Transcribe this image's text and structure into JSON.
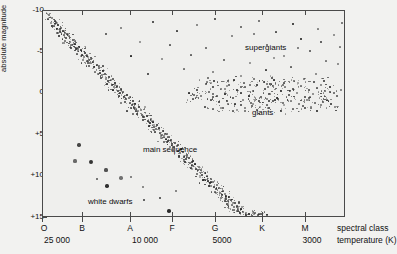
{
  "figure": {
    "kind": "hertzsprung-russell-diagram",
    "background_color": "#f2f2f0",
    "plot_background_color": "#efefed",
    "frame_color": "#4a4a4a",
    "point_color": "#2a2a2a"
  },
  "axes": {
    "y_axis_title": "absolute magnitude",
    "y_tick_labels": [
      "-10",
      "-5",
      "0",
      "+5",
      "+10",
      "+15"
    ],
    "x_class_label": "spectral class",
    "x_temperature_label": "temperature (K)",
    "x_class_ticks": [
      "O",
      "B",
      "A",
      "F",
      "G",
      "K",
      "M"
    ],
    "x_temperature_ticks": [
      "25 000",
      "10 000",
      "5000",
      "3000"
    ]
  },
  "region_labels": [
    {
      "text": "supergiants",
      "x": 245,
      "y": 44
    },
    {
      "text": "giants",
      "x": 252,
      "y": 109
    },
    {
      "text": "main sequence",
      "x": 143,
      "y": 146
    },
    {
      "text": "white dwarfs",
      "x": 88,
      "y": 198
    }
  ],
  "chart_data": {
    "type": "scatter",
    "xlabel": "spectral class / temperature (K)",
    "ylabel": "absolute magnitude",
    "xlim_classes": [
      "O",
      "B",
      "A",
      "F",
      "G",
      "K",
      "M"
    ],
    "ylim": [
      -10,
      15
    ],
    "y_inverted": true,
    "grid": false,
    "legend": "none",
    "x_tick_positions_px": [
      42,
      82,
      130,
      172,
      215,
      262,
      305
    ],
    "y_tick_positions_px": [
      10,
      51,
      92,
      134,
      175,
      217
    ],
    "x_temperature_tick_positions_px": [
      42,
      130,
      215,
      305
    ],
    "annotations": [
      "supergiants",
      "giants",
      "main sequence",
      "white dwarfs"
    ],
    "series": [
      {
        "name": "main sequence",
        "note": "dense diagonal band from upper-left (hot, luminous) to lower-right (cool, faint)",
        "points": [
          [
            45,
            12
          ],
          [
            48,
            14
          ],
          [
            47,
            18
          ],
          [
            51,
            17
          ],
          [
            50,
            22
          ],
          [
            54,
            20
          ],
          [
            53,
            25
          ],
          [
            57,
            24
          ],
          [
            56,
            28
          ],
          [
            60,
            27
          ],
          [
            59,
            31
          ],
          [
            62,
            30
          ],
          [
            58,
            35
          ],
          [
            63,
            34
          ],
          [
            66,
            33
          ],
          [
            65,
            37
          ],
          [
            68,
            36
          ],
          [
            64,
            40
          ],
          [
            69,
            41
          ],
          [
            72,
            39
          ],
          [
            71,
            44
          ],
          [
            74,
            43
          ],
          [
            70,
            47
          ],
          [
            75,
            48
          ],
          [
            78,
            46
          ],
          [
            77,
            50
          ],
          [
            80,
            49
          ],
          [
            76,
            53
          ],
          [
            81,
            54
          ],
          [
            84,
            52
          ],
          [
            83,
            56
          ],
          [
            86,
            55
          ],
          [
            82,
            59
          ],
          [
            87,
            60
          ],
          [
            90,
            58
          ],
          [
            89,
            62
          ],
          [
            92,
            61
          ],
          [
            88,
            65
          ],
          [
            93,
            66
          ],
          [
            96,
            64
          ],
          [
            95,
            68
          ],
          [
            98,
            67
          ],
          [
            94,
            71
          ],
          [
            99,
            72
          ],
          [
            102,
            70
          ],
          [
            101,
            74
          ],
          [
            104,
            73
          ],
          [
            100,
            77
          ],
          [
            105,
            78
          ],
          [
            108,
            76
          ],
          [
            107,
            80
          ],
          [
            110,
            79
          ],
          [
            106,
            83
          ],
          [
            111,
            84
          ],
          [
            114,
            82
          ],
          [
            113,
            86
          ],
          [
            116,
            85
          ],
          [
            112,
            89
          ],
          [
            117,
            90
          ],
          [
            120,
            88
          ],
          [
            119,
            92
          ],
          [
            122,
            91
          ],
          [
            118,
            95
          ],
          [
            123,
            96
          ],
          [
            126,
            94
          ],
          [
            125,
            98
          ],
          [
            128,
            97
          ],
          [
            124,
            101
          ],
          [
            129,
            102
          ],
          [
            132,
            100
          ],
          [
            131,
            104
          ],
          [
            134,
            103
          ],
          [
            130,
            107
          ],
          [
            135,
            108
          ],
          [
            138,
            106
          ],
          [
            137,
            110
          ],
          [
            140,
            109
          ],
          [
            136,
            113
          ],
          [
            141,
            114
          ],
          [
            144,
            112
          ],
          [
            143,
            116
          ],
          [
            146,
            115
          ],
          [
            142,
            119
          ],
          [
            147,
            120
          ],
          [
            150,
            118
          ],
          [
            149,
            122
          ],
          [
            152,
            121
          ],
          [
            148,
            125
          ],
          [
            153,
            126
          ],
          [
            156,
            124
          ],
          [
            155,
            128
          ],
          [
            158,
            127
          ],
          [
            154,
            131
          ],
          [
            159,
            132
          ],
          [
            162,
            130
          ],
          [
            161,
            134
          ],
          [
            164,
            133
          ],
          [
            160,
            137
          ],
          [
            165,
            138
          ],
          [
            168,
            136
          ],
          [
            167,
            140
          ],
          [
            170,
            139
          ],
          [
            166,
            143
          ],
          [
            171,
            144
          ],
          [
            174,
            142
          ],
          [
            173,
            146
          ],
          [
            176,
            145
          ],
          [
            172,
            149
          ],
          [
            177,
            150
          ],
          [
            180,
            148
          ],
          [
            179,
            152
          ],
          [
            182,
            151
          ],
          [
            178,
            155
          ],
          [
            183,
            156
          ],
          [
            186,
            154
          ],
          [
            185,
            158
          ],
          [
            188,
            157
          ],
          [
            184,
            161
          ],
          [
            189,
            162
          ],
          [
            192,
            160
          ],
          [
            191,
            164
          ],
          [
            194,
            163
          ],
          [
            190,
            167
          ],
          [
            195,
            168
          ],
          [
            198,
            166
          ],
          [
            197,
            170
          ],
          [
            200,
            169
          ],
          [
            196,
            173
          ],
          [
            201,
            174
          ],
          [
            204,
            172
          ],
          [
            203,
            176
          ],
          [
            206,
            175
          ],
          [
            202,
            179
          ],
          [
            207,
            180
          ],
          [
            210,
            178
          ],
          [
            209,
            182
          ],
          [
            212,
            181
          ],
          [
            208,
            185
          ],
          [
            213,
            186
          ],
          [
            216,
            184
          ],
          [
            215,
            188
          ],
          [
            218,
            187
          ],
          [
            214,
            191
          ],
          [
            219,
            192
          ],
          [
            222,
            190
          ],
          [
            221,
            194
          ],
          [
            224,
            193
          ],
          [
            220,
            197
          ],
          [
            225,
            198
          ],
          [
            228,
            196
          ],
          [
            227,
            200
          ],
          [
            230,
            199
          ],
          [
            226,
            203
          ],
          [
            231,
            204
          ],
          [
            234,
            202
          ],
          [
            233,
            206
          ],
          [
            236,
            205
          ],
          [
            232,
            209
          ],
          [
            237,
            210
          ],
          [
            240,
            208
          ],
          [
            239,
            212
          ],
          [
            242,
            211
          ],
          [
            245,
            214
          ],
          [
            248,
            213
          ],
          [
            251,
            215
          ],
          [
            254,
            212
          ],
          [
            257,
            214
          ],
          [
            260,
            213
          ],
          [
            263,
            215
          ],
          [
            266,
            214
          ]
        ]
      },
      {
        "name": "supergiants",
        "note": "sparse scatter across the top of the diagram, magnitude about -8 to -3",
        "points": [
          [
            105,
            33
          ],
          [
            120,
            27
          ],
          [
            139,
            41
          ],
          [
            152,
            21
          ],
          [
            161,
            58
          ],
          [
            176,
            30
          ],
          [
            183,
            68
          ],
          [
            196,
            24
          ],
          [
            205,
            47
          ],
          [
            214,
            18
          ],
          [
            223,
            59
          ],
          [
            231,
            35
          ],
          [
            240,
            26
          ],
          [
            249,
            62
          ],
          [
            258,
            20
          ],
          [
            266,
            44
          ],
          [
            275,
            31
          ],
          [
            283,
            55
          ],
          [
            292,
            23
          ],
          [
            300,
            38
          ],
          [
            309,
            50
          ],
          [
            317,
            28
          ],
          [
            325,
            60
          ],
          [
            333,
            34
          ],
          [
            339,
            46
          ],
          [
            212,
            71
          ],
          [
            240,
            75
          ],
          [
            265,
            69
          ],
          [
            290,
            66
          ],
          [
            315,
            73
          ],
          [
            130,
            55
          ],
          [
            147,
            73
          ],
          [
            169,
            44
          ],
          [
            190,
            54
          ],
          [
            253,
            33
          ],
          [
            273,
            57
          ],
          [
            297,
            47
          ],
          [
            320,
            41
          ],
          [
            337,
            63
          ],
          [
            341,
            22
          ]
        ]
      },
      {
        "name": "giants",
        "note": "dense horizontal clump around magnitude 0 to +1 between classes G and M",
        "points": [
          [
            208,
            91
          ],
          [
            212,
            86
          ],
          [
            216,
            95
          ],
          [
            220,
            88
          ],
          [
            224,
            93
          ],
          [
            228,
            84
          ],
          [
            232,
            97
          ],
          [
            236,
            89
          ],
          [
            240,
            92
          ],
          [
            244,
            86
          ],
          [
            248,
            95
          ],
          [
            252,
            90
          ],
          [
            256,
            84
          ],
          [
            260,
            96
          ],
          [
            264,
            88
          ],
          [
            268,
            93
          ],
          [
            272,
            85
          ],
          [
            276,
            97
          ],
          [
            280,
            90
          ],
          [
            284,
            86
          ],
          [
            288,
            94
          ],
          [
            292,
            88
          ],
          [
            296,
            92
          ],
          [
            300,
            85
          ],
          [
            304,
            96
          ],
          [
            308,
            89
          ],
          [
            312,
            93
          ],
          [
            316,
            87
          ],
          [
            320,
            95
          ],
          [
            324,
            90
          ],
          [
            210,
            99
          ],
          [
            218,
            101
          ],
          [
            226,
            100
          ],
          [
            234,
            103
          ],
          [
            242,
            99
          ],
          [
            250,
            102
          ],
          [
            258,
            100
          ],
          [
            266,
            104
          ],
          [
            274,
            99
          ],
          [
            282,
            102
          ],
          [
            290,
            100
          ],
          [
            298,
            103
          ],
          [
            306,
            99
          ],
          [
            314,
            102
          ],
          [
            322,
            101
          ],
          [
            205,
            83
          ],
          [
            213,
            80
          ],
          [
            223,
            81
          ],
          [
            233,
            79
          ],
          [
            243,
            82
          ],
          [
            253,
            78
          ],
          [
            263,
            81
          ],
          [
            273,
            79
          ],
          [
            283,
            82
          ],
          [
            293,
            80
          ],
          [
            303,
            78
          ],
          [
            313,
            81
          ],
          [
            323,
            80
          ],
          [
            329,
            86
          ],
          [
            333,
            92
          ],
          [
            200,
            95
          ],
          [
            196,
            89
          ],
          [
            192,
            98
          ],
          [
            188,
            92
          ],
          [
            204,
            106
          ],
          [
            212,
            108
          ],
          [
            222,
            107
          ],
          [
            232,
            110
          ],
          [
            244,
            107
          ],
          [
            256,
            109
          ],
          [
            268,
            107
          ],
          [
            280,
            110
          ],
          [
            292,
            108
          ],
          [
            304,
            107
          ],
          [
            316,
            110
          ],
          [
            326,
            99
          ],
          [
            330,
            103
          ],
          [
            336,
            95
          ],
          [
            340,
            89
          ],
          [
            334,
            106
          ]
        ]
      },
      {
        "name": "white dwarfs",
        "note": "isolated faint, hot stars at the lower left, magnitude about +9 to +13",
        "points": [
          [
            78,
            144
          ],
          [
            74,
            160
          ],
          [
            90,
            161
          ],
          [
            105,
            169
          ],
          [
            120,
            177
          ],
          [
            96,
            178
          ],
          [
            130,
            176
          ],
          [
            106,
            185
          ],
          [
            142,
            186
          ],
          [
            143,
            199
          ],
          [
            159,
            197
          ],
          [
            168,
            210
          ],
          [
            175,
            190
          ]
        ]
      }
    ]
  }
}
